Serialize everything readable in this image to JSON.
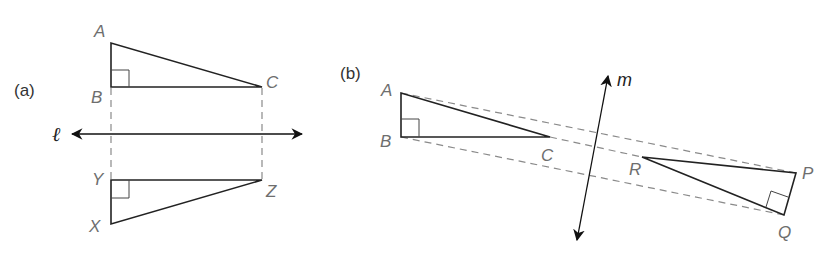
{
  "figure": {
    "panel_a": {
      "label": "(a)",
      "line_label": "ℓ",
      "original": {
        "vertices": [
          "A",
          "B",
          "C"
        ],
        "right_angle_at": "B"
      },
      "image": {
        "vertices": [
          "X",
          "Y",
          "Z"
        ],
        "right_angle_at": "Y"
      },
      "labels": {
        "A": "A",
        "B": "B",
        "C": "C",
        "X": "X",
        "Y": "Y",
        "Z": "Z"
      }
    },
    "panel_b": {
      "label": "(b)",
      "line_label": "m",
      "original": {
        "vertices": [
          "A",
          "B",
          "C"
        ],
        "right_angle_at": "B"
      },
      "image": {
        "vertices": [
          "P",
          "Q",
          "R"
        ],
        "right_angle_at": "Q"
      },
      "labels": {
        "A": "A",
        "B": "B",
        "C": "C",
        "P": "P",
        "Q": "Q",
        "R": "R"
      }
    },
    "colors": {
      "stroke": "#222222",
      "dashed": "#8a8a8a",
      "label": "#6e6e6e"
    }
  }
}
